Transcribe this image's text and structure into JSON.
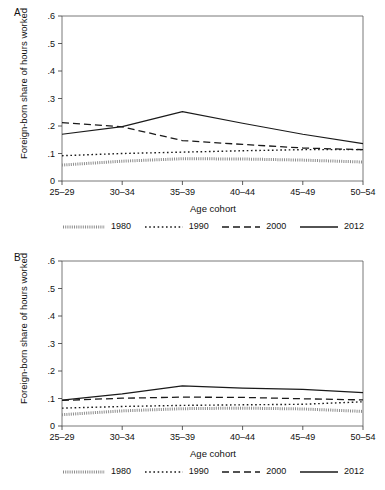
{
  "figure": {
    "panels": [
      {
        "letter": "A",
        "ylabel": "Foreign-born share of hours worked",
        "xlabel": "Age cohort"
      },
      {
        "letter": "B",
        "ylabel": "Foreign-born share of hours worked",
        "xlabel": "Age cohort"
      }
    ],
    "legend": [
      {
        "label": "1980",
        "style": "fine-dotted"
      },
      {
        "label": "1990",
        "style": "dotted"
      },
      {
        "label": "2000",
        "style": "dashed"
      },
      {
        "label": "2012",
        "style": "solid"
      }
    ],
    "ytick_labels": [
      "0",
      ".1",
      ".2",
      ".3",
      ".4",
      ".5",
      ".6"
    ],
    "xtick_labels": [
      "25–29",
      "30–34",
      "35–39",
      "40–44",
      "45–49",
      "50–54"
    ]
  },
  "chart_data": [
    {
      "type": "line",
      "panel": "A",
      "title": "",
      "xlabel": "Age cohort",
      "ylabel": "Foreign-born share of hours worked",
      "categories": [
        "25–29",
        "30–34",
        "35–39",
        "40–44",
        "45–49",
        "50–54"
      ],
      "ylim": [
        0,
        0.6
      ],
      "yticks": [
        0,
        0.1,
        0.2,
        0.3,
        0.4,
        0.5,
        0.6
      ],
      "grid": false,
      "legend_position": "below",
      "series": [
        {
          "name": "1980",
          "style": "fine-dotted",
          "color": "#8c8c8c",
          "values": [
            0.058,
            0.072,
            0.081,
            0.08,
            0.076,
            0.069
          ]
        },
        {
          "name": "1990",
          "style": "dotted",
          "color": "#1a1a1a",
          "values": [
            0.092,
            0.1,
            0.105,
            0.11,
            0.114,
            0.114
          ]
        },
        {
          "name": "2000",
          "style": "dashed",
          "color": "#1a1a1a",
          "values": [
            0.212,
            0.197,
            0.147,
            0.133,
            0.12,
            0.114
          ]
        },
        {
          "name": "2012",
          "style": "solid",
          "color": "#1a1a1a",
          "values": [
            0.17,
            0.198,
            0.252,
            0.21,
            0.17,
            0.136
          ]
        }
      ]
    },
    {
      "type": "line",
      "panel": "B",
      "title": "",
      "xlabel": "Age cohort",
      "ylabel": "Foreign-born share of hours worked",
      "categories": [
        "25–29",
        "30–34",
        "35–39",
        "40–44",
        "45–49",
        "50–54"
      ],
      "ylim": [
        0,
        0.6
      ],
      "yticks": [
        0,
        0.1,
        0.2,
        0.3,
        0.4,
        0.5,
        0.6
      ],
      "grid": false,
      "legend_position": "below",
      "series": [
        {
          "name": "1980",
          "style": "fine-dotted",
          "color": "#8c8c8c",
          "values": [
            0.041,
            0.055,
            0.063,
            0.065,
            0.062,
            0.053
          ]
        },
        {
          "name": "1990",
          "style": "dotted",
          "color": "#1a1a1a",
          "values": [
            0.065,
            0.071,
            0.075,
            0.077,
            0.079,
            0.088
          ]
        },
        {
          "name": "2000",
          "style": "dashed",
          "color": "#1a1a1a",
          "values": [
            0.093,
            0.101,
            0.105,
            0.104,
            0.099,
            0.095
          ]
        },
        {
          "name": "2012",
          "style": "solid",
          "color": "#1a1a1a",
          "values": [
            0.094,
            0.117,
            0.146,
            0.138,
            0.133,
            0.121
          ]
        }
      ]
    }
  ]
}
